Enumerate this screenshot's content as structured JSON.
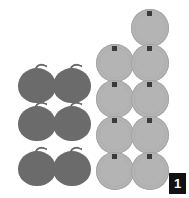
{
  "canvas": {
    "width": 189,
    "height": 198,
    "background": "#ffffff"
  },
  "badge": {
    "label": "1",
    "background": "#111111",
    "text_color": "#ffffff"
  },
  "groups": [
    {
      "id": "dark-apples",
      "name": "dark-fruit-group",
      "item_type": "apple",
      "color": "#6b6b6b",
      "count": 6,
      "columns": 2,
      "rows": 3,
      "items": [
        {
          "label": "apple-1",
          "x": 18,
          "y": 63
        },
        {
          "label": "apple-2",
          "x": 53,
          "y": 63
        },
        {
          "label": "apple-3",
          "x": 18,
          "y": 101
        },
        {
          "label": "apple-4",
          "x": 53,
          "y": 101
        },
        {
          "label": "apple-5",
          "x": 18,
          "y": 146
        },
        {
          "label": "apple-6",
          "x": 53,
          "y": 146
        }
      ]
    },
    {
      "id": "light-discs",
      "name": "light-fruit-group",
      "item_type": "disc",
      "color": "#b4b4b4",
      "nub_color": "#3a3a3a",
      "count": 9,
      "items": [
        {
          "label": "disc-1",
          "x": 131,
          "y": 9
        },
        {
          "label": "disc-2",
          "x": 96,
          "y": 44
        },
        {
          "label": "disc-3",
          "x": 131,
          "y": 44
        },
        {
          "label": "disc-4",
          "x": 96,
          "y": 80
        },
        {
          "label": "disc-5",
          "x": 131,
          "y": 80
        },
        {
          "label": "disc-6",
          "x": 96,
          "y": 116
        },
        {
          "label": "disc-7",
          "x": 131,
          "y": 116
        },
        {
          "label": "disc-8",
          "x": 96,
          "y": 152
        },
        {
          "label": "disc-9",
          "x": 131,
          "y": 152
        }
      ]
    }
  ]
}
